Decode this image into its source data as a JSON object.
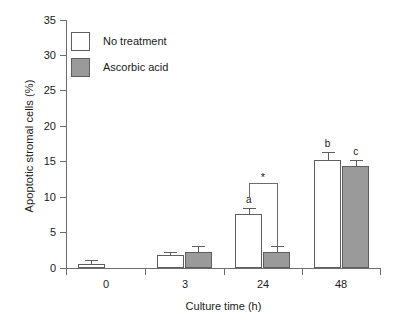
{
  "chart_data": {
    "type": "bar",
    "title": "",
    "xlabel": "Culture time (h)",
    "ylabel": "Apoptotic stromal cells (%)",
    "categories": [
      "0",
      "3",
      "24",
      "48"
    ],
    "ylim": [
      0,
      35
    ],
    "yticks": [
      0,
      5,
      10,
      15,
      20,
      25,
      30,
      35
    ],
    "ytick_labels": [
      "0",
      "5",
      "10",
      "15",
      "20",
      "25",
      "30",
      "35"
    ],
    "grid": false,
    "legend_position": "top-left",
    "series": [
      {
        "name": "No treatment",
        "color": "#ffffff",
        "values": [
          0.6,
          1.8,
          7.6,
          15.2
        ],
        "errors": [
          0.5,
          0.4,
          0.9,
          1.2
        ]
      },
      {
        "name": "Ascorbic acid",
        "color": "#9a9a9a",
        "values": [
          null,
          2.3,
          2.3,
          14.4
        ],
        "errors": [
          null,
          0.8,
          0.8,
          0.9
        ]
      }
    ],
    "annotations": [
      {
        "text": "a",
        "series": "No treatment",
        "category": "24"
      },
      {
        "text": "b",
        "series": "No treatment",
        "category": "48"
      },
      {
        "text": "c",
        "series": "Ascorbic acid",
        "category": "48"
      },
      {
        "text": "*",
        "type": "significance-bracket",
        "category": "24",
        "between": [
          "No treatment",
          "Ascorbic acid"
        ]
      }
    ]
  },
  "axis": {
    "y_title": "Apoptotic stromal cells (%)",
    "x_title": "Culture time (h)",
    "y_labels": [
      "35",
      "30",
      "25",
      "20",
      "15",
      "10",
      "5",
      "0"
    ],
    "x_labels": [
      "0",
      "3",
      "24",
      "48"
    ]
  },
  "legend": {
    "items": [
      {
        "label": "No treatment",
        "swatch": "white"
      },
      {
        "label": "Ascorbic acid",
        "swatch": "gray"
      }
    ]
  },
  "annotations": {
    "a": "a",
    "b": "b",
    "c": "c",
    "star": "*"
  }
}
